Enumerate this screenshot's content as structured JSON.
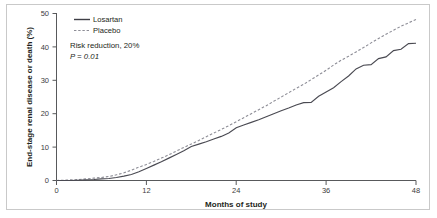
{
  "figure": {
    "background_color": "#ffffff",
    "border_color": "#c9c9c9"
  },
  "chart_data": {
    "type": "line",
    "title": "",
    "subtitle": "",
    "xlabel": "Months of study",
    "ylabel": "End-stage renal disease or death (%)",
    "xlim": [
      0,
      48
    ],
    "ylim": [
      0,
      50
    ],
    "xticks": [
      0,
      12,
      24,
      36,
      48
    ],
    "xtick_labels": [
      "0",
      "12",
      "24",
      "36",
      "48"
    ],
    "yticks": [
      0,
      10,
      20,
      30,
      40,
      50
    ],
    "ytick_labels": [
      "0",
      "10",
      "20",
      "30",
      "40",
      "50"
    ],
    "grid": false,
    "legend_position": "top-left",
    "annotations": [
      "Risk reduction, 20%",
      "P = 0.01"
    ],
    "series": [
      {
        "name": "Losartan",
        "style": "solid",
        "color": "#4a4a52",
        "x": [
          0,
          2,
          4,
          5,
          6,
          7,
          8,
          9,
          10,
          11,
          12,
          13,
          14,
          15,
          16,
          17,
          18,
          19,
          20,
          21,
          22,
          23,
          24,
          25,
          26,
          27,
          28,
          29,
          30,
          31,
          32,
          33,
          34,
          35,
          36,
          37,
          38,
          39,
          40,
          41,
          42,
          43,
          44,
          45,
          46,
          47,
          48
        ],
        "y": [
          0,
          0,
          0.2,
          0.3,
          0.5,
          0.6,
          0.9,
          1.3,
          1.8,
          2.6,
          3.6,
          4.6,
          5.6,
          6.7,
          7.8,
          8.9,
          10.2,
          10.9,
          11.6,
          12.4,
          13.2,
          14.2,
          15.8,
          16.6,
          17.4,
          18.2,
          19.1,
          20.0,
          20.9,
          21.7,
          22.6,
          23.3,
          23.4,
          25.2,
          26.5,
          27.8,
          29.6,
          31.3,
          33.4,
          34.5,
          34.7,
          36.5,
          37.0,
          38.9,
          39.3,
          41.0,
          41.1
        ]
      },
      {
        "name": "Placebo",
        "style": "dashed",
        "color": "#8d8d96",
        "x": [
          0,
          2,
          3,
          4,
          5,
          6,
          7,
          8,
          9,
          10,
          11,
          12,
          13,
          14,
          15,
          16,
          17,
          18,
          19,
          20,
          21,
          22,
          23,
          24,
          25,
          26,
          27,
          28,
          29,
          30,
          31,
          32,
          33,
          34,
          35,
          36,
          37,
          38,
          39,
          40,
          41,
          42,
          43,
          44,
          45,
          46,
          47,
          48
        ],
        "y": [
          0,
          0.2,
          0.3,
          0.5,
          0.7,
          0.9,
          1.2,
          1.7,
          2.3,
          3.1,
          4.0,
          4.8,
          5.7,
          6.7,
          7.7,
          8.8,
          9.9,
          10.9,
          12.0,
          13.1,
          14.2,
          15.3,
          16.4,
          17.6,
          18.8,
          20.0,
          21.2,
          22.4,
          23.7,
          25.0,
          26.3,
          27.6,
          28.8,
          30.2,
          31.6,
          33.0,
          34.6,
          36.0,
          37.2,
          38.5,
          39.8,
          41.2,
          42.5,
          43.8,
          45.0,
          46.2,
          47.2,
          48.2
        ]
      }
    ]
  },
  "legend": {
    "items": [
      {
        "label": "Losartan",
        "style": "solid"
      },
      {
        "label": "Placebo",
        "style": "dashed"
      }
    ]
  }
}
